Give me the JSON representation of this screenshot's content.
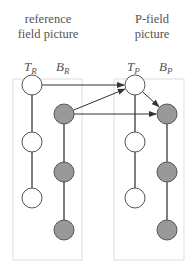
{
  "panels": [
    {
      "id": "reference",
      "title_line1": "reference",
      "title_line2": "field picture",
      "columns": [
        {
          "label": "T",
          "subscript": "R",
          "fill": "white",
          "nodes": 3
        },
        {
          "label": "B",
          "subscript": "R",
          "fill": "gray",
          "nodes": 3
        }
      ]
    },
    {
      "id": "p-field",
      "title_line1": "P-field",
      "title_line2": "picture",
      "columns": [
        {
          "label": "T",
          "subscript": "P",
          "fill": "white",
          "nodes": 3
        },
        {
          "label": "B",
          "subscript": "P",
          "fill": "gray",
          "nodes": 3
        }
      ]
    }
  ],
  "arrows": [
    {
      "from": "T_R.0",
      "to": "T_P.0"
    },
    {
      "from": "B_R.0",
      "to": "T_P.0"
    },
    {
      "from": "B_R.0",
      "to": "B_P.0"
    },
    {
      "from": "T_P.0",
      "to": "B_P.0"
    }
  ],
  "colors": {
    "white_node": "#ffffff",
    "gray_node": "#999999",
    "stroke": "#555555",
    "box": "#dddddd",
    "text": "#555555"
  }
}
